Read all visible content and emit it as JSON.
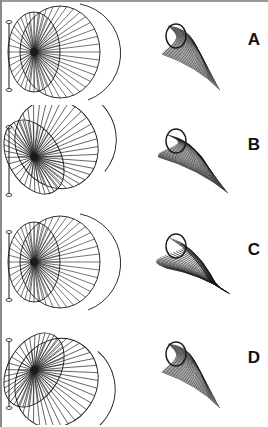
{
  "figure": {
    "panels": [
      {
        "label": "A",
        "top": 0,
        "wheel_rot": 0,
        "fan_style": "shell"
      },
      {
        "label": "B",
        "top": 105,
        "wheel_rot": -30,
        "fan_style": "twist"
      },
      {
        "label": "C",
        "top": 210,
        "wheel_rot": 0,
        "fan_style": "spiral"
      },
      {
        "label": "D",
        "top": 318,
        "wheel_rot": 30,
        "fan_style": "shell"
      }
    ],
    "colors": {
      "line": "#1a1a1a",
      "border": "#8a8a8a",
      "background": "#ffffff"
    }
  }
}
